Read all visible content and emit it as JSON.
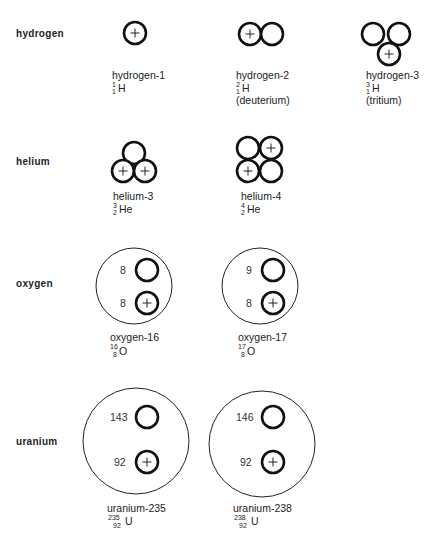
{
  "diagram": {
    "rows": [
      {
        "element": "hydrogen",
        "isotopes": [
          {
            "name": "hydrogen-1",
            "mass": "1",
            "atomic": "1",
            "symbol": "H",
            "note": "",
            "protons": 1,
            "neutrons": 0
          },
          {
            "name": "hydrogen-2",
            "mass": "2",
            "atomic": "1",
            "symbol": "H",
            "note": "(deuterium)",
            "protons": 1,
            "neutrons": 1
          },
          {
            "name": "hydrogen-3",
            "mass": "3",
            "atomic": "1",
            "symbol": "H",
            "note": "(tritium)",
            "protons": 1,
            "neutrons": 2
          }
        ]
      },
      {
        "element": "helium",
        "isotopes": [
          {
            "name": "helium-3",
            "mass": "3",
            "atomic": "2",
            "symbol": "He",
            "protons": 2,
            "neutrons": 1
          },
          {
            "name": "helium-4",
            "mass": "4",
            "atomic": "2",
            "symbol": "He",
            "protons": 2,
            "neutrons": 2
          }
        ]
      },
      {
        "element": "oxygen",
        "isotopes": [
          {
            "name": "oxygen-16",
            "mass": "16",
            "atomic": "8",
            "symbol": "O",
            "neutron_count": "8",
            "proton_count": "8"
          },
          {
            "name": "oxygen-17",
            "mass": "17",
            "atomic": "8",
            "symbol": "O",
            "neutron_count": "9",
            "proton_count": "8"
          }
        ]
      },
      {
        "element": "uranium",
        "isotopes": [
          {
            "name": "uranium-235",
            "mass": "235",
            "atomic": "92",
            "symbol": "U",
            "neutron_count": "143",
            "proton_count": "92"
          },
          {
            "name": "uranium-238",
            "mass": "238",
            "atomic": "92",
            "symbol": "U",
            "neutron_count": "146",
            "proton_count": "92"
          }
        ]
      }
    ],
    "icons": {
      "proton": "circle-with-plus",
      "neutron": "empty-circle",
      "nucleus": "large-thin-circle"
    },
    "colors": {
      "stroke": "#111111",
      "text": "#222222",
      "background": "#ffffff"
    }
  }
}
